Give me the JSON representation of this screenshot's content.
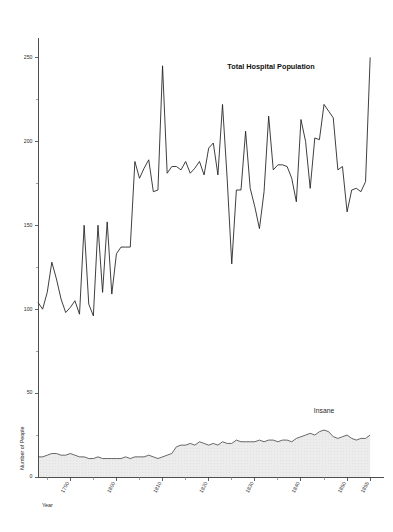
{
  "chart_data": {
    "type": "line",
    "title": "",
    "xlabel": "Year",
    "ylabel": "Number of People",
    "xlim": [
      1783,
      1858
    ],
    "ylim": [
      0,
      258
    ],
    "grid": false,
    "legend_position": "inline-annotation",
    "y_ticks_major": [
      0,
      50,
      100,
      150,
      200,
      250
    ],
    "y_ticks_minor": [
      25,
      75,
      125,
      175,
      225
    ],
    "x_ticks_major": [
      1790,
      1800,
      1810,
      1820,
      1830,
      1840,
      1850,
      1855
    ],
    "x_ticks_minor": [
      1785,
      1795,
      1805,
      1815,
      1825,
      1835,
      1845
    ],
    "x_tick_labels": [
      "1790",
      "1800",
      "1810",
      "1820",
      "1830",
      "1840",
      "1850",
      "1855"
    ],
    "y_tick_labels": [
      "0",
      "50",
      "100",
      "150",
      "200",
      "250"
    ],
    "annotations": [
      {
        "text": "Total Hospital Population",
        "x": 1843,
        "y": 243
      },
      {
        "text": "Insane",
        "x": 1845,
        "y": 38
      }
    ],
    "x": [
      1783,
      1784,
      1785,
      1786,
      1787,
      1788,
      1789,
      1790,
      1791,
      1792,
      1793,
      1794,
      1795,
      1796,
      1797,
      1798,
      1799,
      1800,
      1801,
      1802,
      1803,
      1804,
      1805,
      1806,
      1807,
      1808,
      1809,
      1810,
      1811,
      1812,
      1813,
      1814,
      1815,
      1816,
      1817,
      1818,
      1819,
      1820,
      1821,
      1822,
      1823,
      1824,
      1825,
      1826,
      1827,
      1828,
      1829,
      1830,
      1831,
      1832,
      1833,
      1834,
      1835,
      1836,
      1837,
      1838,
      1839,
      1840,
      1841,
      1842,
      1843,
      1844,
      1845,
      1846,
      1847,
      1848,
      1849,
      1850,
      1851,
      1852,
      1853,
      1854,
      1855
    ],
    "series": [
      {
        "name": "Total Hospital Population",
        "style": "line",
        "color": "#1c1c1c",
        "values": [
          104,
          100,
          110,
          128,
          118,
          106,
          98,
          101,
          105,
          97,
          150,
          103,
          96,
          150,
          110,
          152,
          109,
          133,
          137,
          137,
          137,
          188,
          178,
          184,
          189,
          170,
          171,
          245,
          181,
          185,
          185,
          183,
          188,
          181,
          184,
          188,
          180,
          196,
          199,
          180,
          222,
          178,
          127,
          171,
          171,
          206,
          172,
          161,
          148,
          170,
          215,
          183,
          186,
          186,
          185,
          178,
          164,
          213,
          200,
          172,
          202,
          201,
          222,
          218,
          214,
          183,
          185,
          158,
          171,
          172,
          170,
          176,
          250
        ]
      },
      {
        "name": "Insane",
        "style": "area",
        "color": "#444444",
        "fill": "#e8e8e8",
        "values": [
          12,
          12,
          13,
          14,
          14,
          13,
          13,
          14,
          13,
          12,
          12,
          11,
          11,
          12,
          11,
          11,
          11,
          11,
          11,
          12,
          11,
          12,
          12,
          12,
          13,
          12,
          11,
          12,
          13,
          14,
          18,
          19,
          19,
          20,
          19,
          21,
          20,
          19,
          20,
          19,
          21,
          20,
          20,
          22,
          21,
          21,
          21,
          21,
          22,
          21,
          22,
          22,
          21,
          22,
          22,
          21,
          23,
          24,
          25,
          26,
          25,
          27,
          28,
          27,
          24,
          23,
          24,
          25,
          23,
          22,
          23,
          23,
          25
        ]
      }
    ]
  },
  "axes": {
    "x_axis_title": "Year",
    "y_axis_title": "Number of People"
  }
}
